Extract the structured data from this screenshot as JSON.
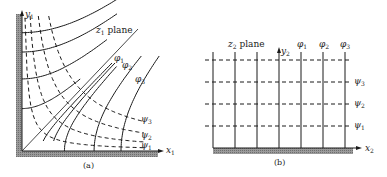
{
  "figure": {
    "panels": [
      {
        "id": "a",
        "caption": "(a)",
        "plane_label": {
          "var": "z",
          "sub": "1",
          "text": " plane"
        },
        "x_axis": {
          "var": "x",
          "sub": "1"
        },
        "y_axis": {
          "var": "y",
          "sub": "1"
        },
        "phi_labels": [
          {
            "var": "φ",
            "sub": "1"
          },
          {
            "var": "φ",
            "sub": "2"
          },
          {
            "var": "φ",
            "sub": "3"
          }
        ],
        "psi_labels": [
          {
            "var": "ψ",
            "sub": "3"
          },
          {
            "var": "ψ",
            "sub": "2"
          },
          {
            "var": "ψ",
            "sub": "1"
          }
        ],
        "description": "Flow in a 90° corner: solid equipotential curves (φ) and dashed streamlines (ψ), with diagonal symmetry line"
      },
      {
        "id": "b",
        "caption": "(b)",
        "plane_label": {
          "var": "z",
          "sub": "2",
          "text": " plane"
        },
        "x_axis": {
          "var": "x",
          "sub": "2"
        },
        "y_axis": {
          "var": "y",
          "sub": "2"
        },
        "phi_labels": [
          {
            "var": "φ",
            "sub": "1"
          },
          {
            "var": "φ",
            "sub": "2"
          },
          {
            "var": "φ",
            "sub": "3"
          }
        ],
        "psi_labels": [
          {
            "var": "ψ",
            "sub": "3"
          },
          {
            "var": "ψ",
            "sub": "2"
          },
          {
            "var": "ψ",
            "sub": "1"
          }
        ],
        "description": "Uniform flow over a flat wall: solid vertical equipotentials (φ) and dashed horizontal streamlines (ψ)"
      }
    ],
    "colors": {
      "ink": "#1a1a1a",
      "wall_shade": "#8a8a8a",
      "background": "#ffffff"
    }
  }
}
